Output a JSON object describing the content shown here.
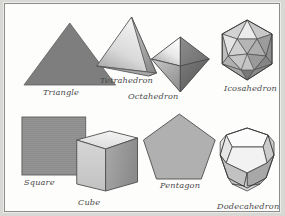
{
  "figure": {
    "background_color": "#fdfdfc",
    "frame_color": "#8d8d8d",
    "outer_color": "#d8d8d4",
    "label_color": "#4a4a4a",
    "rows": [
      {
        "row": 1,
        "shapes": [
          {
            "label": "Triangle",
            "kind": "2d",
            "sides": 3,
            "fill": "#7e7e7e"
          },
          {
            "label": "Tetrahedron",
            "kind": "3d",
            "faces": 4,
            "fill": "#d2d2d2"
          },
          {
            "label": "Octahedron",
            "kind": "3d",
            "faces": 8,
            "fill": "#9a9a9a"
          },
          {
            "label": "Icosahedron",
            "kind": "3d",
            "faces": 20,
            "fill": "#bdbdbd"
          }
        ]
      },
      {
        "row": 2,
        "shapes": [
          {
            "label": "Square",
            "kind": "2d",
            "sides": 4,
            "fill": "#8c8c8c"
          },
          {
            "label": "Cube",
            "kind": "3d",
            "faces": 6,
            "fill": "#cfcfcf"
          },
          {
            "label": "Pentagon",
            "kind": "2d",
            "sides": 5,
            "fill": "#b0b0b0"
          },
          {
            "label": "Dodecahedron",
            "kind": "3d",
            "faces": 12,
            "fill": "#dcdcdc"
          }
        ]
      }
    ],
    "labels": {
      "triangle": "Triangle",
      "tetrahedron": "Tetrahedron",
      "octahedron": "Octahedron",
      "icosahedron": "Icosahedron",
      "square": "Square",
      "cube": "Cube",
      "pentagon": "Pentagon",
      "dodecahedron": "Dodecahedron"
    }
  }
}
